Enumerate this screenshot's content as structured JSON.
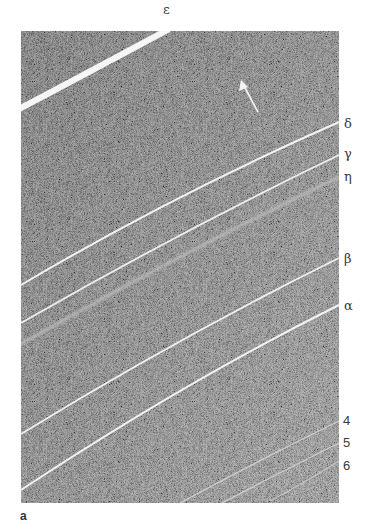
{
  "figure": {
    "panel_label": "a",
    "image_description": "Grainy grayscale photograph of a planetary ring system showing narrow bright rings crossing diagonally",
    "colors": {
      "background_page": "#ffffff",
      "photo_dark": "#5d5d5d",
      "photo_light": "#8a8a8a",
      "ring_bright": "#f4f4f4",
      "label_text": "#3a3a3a"
    },
    "rings": [
      {
        "id": "epsilon",
        "label": "ε",
        "label_pos": {
          "x": 163,
          "y": 3
        }
      },
      {
        "id": "delta",
        "label": "δ",
        "label_pos": {
          "x": 344,
          "y": 118
        }
      },
      {
        "id": "gamma",
        "label": "γ",
        "label_pos": {
          "x": 344,
          "y": 147
        }
      },
      {
        "id": "eta",
        "label": "η",
        "label_pos": {
          "x": 344,
          "y": 170
        }
      },
      {
        "id": "beta",
        "label": "β",
        "label_pos": {
          "x": 344,
          "y": 253
        }
      },
      {
        "id": "alpha",
        "label": "α",
        "label_pos": {
          "x": 344,
          "y": 299
        }
      },
      {
        "id": "ring-4",
        "label": "4",
        "label_pos": {
          "x": 343,
          "y": 414
        }
      },
      {
        "id": "ring-5",
        "label": "5",
        "label_pos": {
          "x": 343,
          "y": 436
        }
      },
      {
        "id": "ring-6",
        "label": "6",
        "label_pos": {
          "x": 343,
          "y": 459
        }
      }
    ],
    "arrow": {
      "direction": "up-left",
      "color": "#ffffff"
    }
  }
}
